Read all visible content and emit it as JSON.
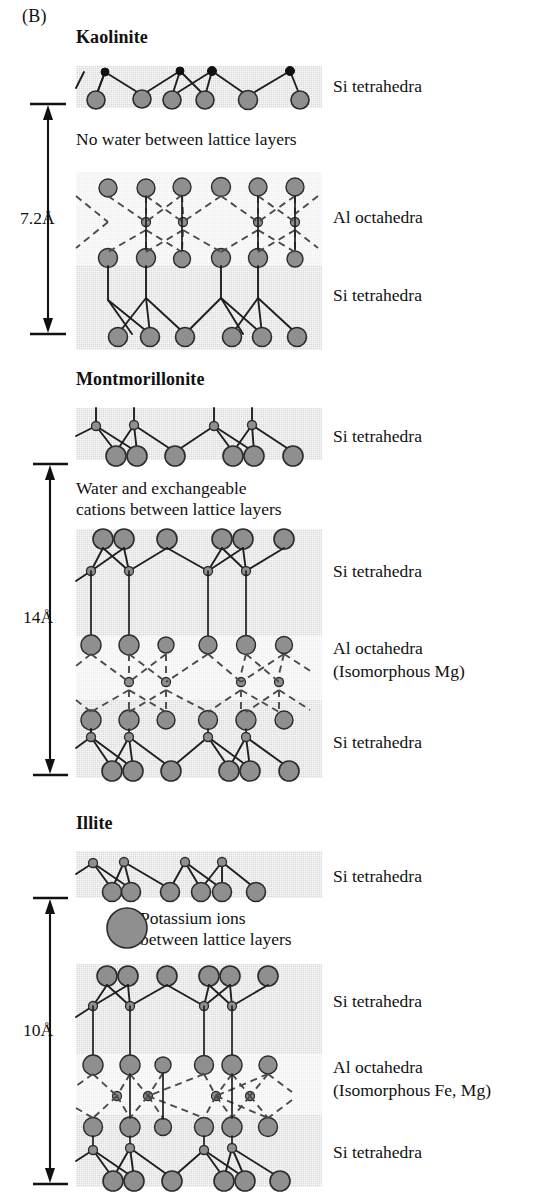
{
  "figure": {
    "panel_letter": "(B)"
  },
  "minerals": [
    {
      "name": "Kaolinite",
      "spacing_label": "7.2Å",
      "interlayer_note": "No water between lattice layers",
      "layers": [
        {
          "label": "Si tetrahedra"
        },
        {
          "label": "Al octahedra"
        },
        {
          "label": "Si tetrahedra"
        }
      ]
    },
    {
      "name": "Montmorillonite",
      "spacing_label": "14Å",
      "interlayer_note_line1": "Water and exchangeable",
      "interlayer_note_line2": "cations between lattice layers",
      "layers": [
        {
          "label": "Si tetrahedra"
        },
        {
          "label": "Si tetrahedra"
        },
        {
          "label": "Al octahedra",
          "sublabel": "(Isomorphous Mg)"
        },
        {
          "label": "Si tetrahedra"
        }
      ]
    },
    {
      "name": "Illite",
      "spacing_label": "10Å",
      "interlayer_note_line1": "Potassium ions",
      "interlayer_note_line2": "between lattice layers",
      "layers": [
        {
          "label": "Si tetrahedra"
        },
        {
          "label": "Si tetrahedra"
        },
        {
          "label": "Al octahedra",
          "sublabel": "(Isomorphous Fe, Mg)"
        },
        {
          "label": "Si tetrahedra"
        }
      ]
    }
  ],
  "colors": {
    "atom_fill": "#8f8f8f",
    "atom_stroke": "#2b2b2b",
    "band_si": "#d9d9d9",
    "band_al": "#f0f0f0",
    "bond": "#1f1f1f",
    "dashed_bond": "#4a4a4a",
    "text": "#111111"
  }
}
